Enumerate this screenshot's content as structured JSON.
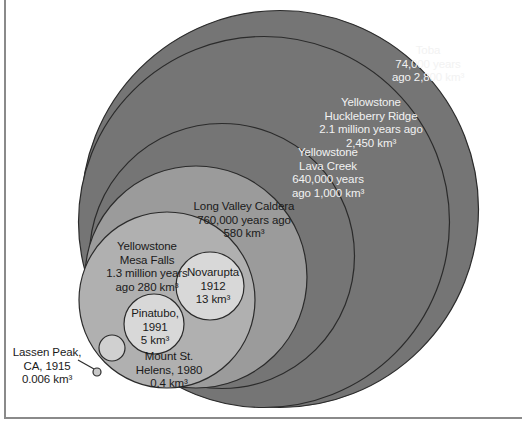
{
  "figure": {
    "type": "bubble-area-comparison",
    "background": "#ffffff",
    "frame_color": "#8a8a8a",
    "unit": "km^3"
  },
  "chart_data": {
    "type": "scatter",
    "title": "",
    "xlabel": "",
    "ylabel": "",
    "categories": [
      "Toba",
      "Yellowstone Huckleberry Ridge",
      "Yellowstone Lava Creek",
      "Long Valley Caldera",
      "Yellowstone Mesa Falls",
      "Novarupta",
      "Pinatubo",
      "Mount St. Helens",
      "Lassen Peak, CA"
    ],
    "values": [
      2800,
      2450,
      1000,
      580,
      280,
      13,
      5,
      0.4,
      0.006
    ],
    "value_unit": "km³",
    "dates": [
      "74,000 years ago",
      "2.1 million years ago",
      "640,000 years ago",
      "760,000 years ago",
      "1.3 million years ago",
      "1912",
      "1991",
      "1980",
      "1915"
    ]
  },
  "circles": [
    {
      "id": "toba",
      "name": "Toba",
      "fill": "#757575",
      "stroke": "#2b2b2b",
      "cx": 280.0,
      "cy": 209.0,
      "r": 198.5,
      "volume_km3": 2800
    },
    {
      "id": "huckleberry-ridge",
      "name": "Yellowstone Huckleberry Ridge",
      "fill": "#757575",
      "stroke": "#2b2b2b",
      "cx": 264.0,
      "cy": 222.0,
      "r": 185.5,
      "volume_km3": 2450
    },
    {
      "id": "lava-creek",
      "name": "Yellowstone Lava Creek",
      "fill": "#757575",
      "stroke": "#2b2b2b",
      "cx": 222.0,
      "cy": 256.0,
      "r": 132.5,
      "volume_km3": 1000
    },
    {
      "id": "long-valley",
      "name": "Long Valley Caldera",
      "fill": "#9b9b9b",
      "stroke": "#2b2b2b",
      "cx": 196.0,
      "cy": 277.0,
      "r": 111.0,
      "volume_km3": 580
    },
    {
      "id": "mesa-falls",
      "name": "Yellowstone Mesa Falls",
      "fill": "#b0b0b0",
      "stroke": "#2b2b2b",
      "cx": 167.0,
      "cy": 300.0,
      "r": 88.0,
      "volume_km3": 280
    },
    {
      "id": "novarupta",
      "name": "Novarupta",
      "fill": "#d8d8d8",
      "stroke": "#2b2b2b",
      "cx": 210.0,
      "cy": 286.0,
      "r": 34.0,
      "volume_km3": 13
    },
    {
      "id": "pinatubo",
      "name": "Pinatubo",
      "fill": "#d8d8d8",
      "stroke": "#2b2b2b",
      "cx": 154.0,
      "cy": 324.0,
      "r": 30.0,
      "volume_km3": 5
    },
    {
      "id": "mount-st-helens",
      "name": "Mount St. Helens",
      "fill": "#d0d0d0",
      "stroke": "#2b2b2b",
      "cx": 112.0,
      "cy": 348.0,
      "r": 13.0,
      "volume_km3": 0.4
    },
    {
      "id": "lassen-peak",
      "name": "Lassen Peak, CA",
      "fill": "#c8c8c8",
      "stroke": "#2b2b2b",
      "cx": 97.0,
      "cy": 372.0,
      "r": 4.0,
      "volume_km3": 0.006
    }
  ],
  "leader_line": {
    "name": "lassen-peak-leader",
    "x1": 78.0,
    "y1": 360.0,
    "x2": 94.0,
    "y2": 369.0,
    "color": "#2b2b2b"
  },
  "labels": {
    "toba": "Toba\n74,000 years\nago 2,800 km³",
    "huckleberry_ridge": "Yellowstone\nHuckleberry Ridge\n2.1 million years ago\n2,450 km³",
    "lava_creek": "Yellowstone\nLava Creek\n640,000 years\nago 1,000 km³",
    "long_valley": "Long Valley Caldera\n760,000 years ago\n580 km³",
    "mesa_falls": "Yellowstone\nMesa Falls\n1.3 million years\nago 280 km³",
    "novarupta": "Novarupta\n1912\n13 km³",
    "pinatubo": "Pinatubo,\n1991\n5 km³",
    "mount_st_helens": "Mount St.\nHelens, 1980\n0.4 km³",
    "lassen_peak": "Lassen Peak,\nCA, 1915\n0.006 km³"
  }
}
